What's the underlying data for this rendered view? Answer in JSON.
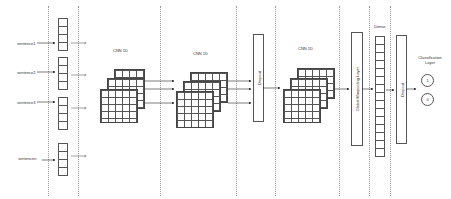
{
  "diagram": {
    "inputs": [
      {
        "label": "sentence1"
      },
      {
        "label": "sentence2"
      },
      {
        "label": "sentence3"
      },
      {
        "label": "sentencen"
      }
    ],
    "stages": {
      "cnn1": {
        "label": "CNN 1D"
      },
      "cnn2": {
        "label": "CNN 1D"
      },
      "dropout1": {
        "label": "Dropout"
      },
      "cnn3": {
        "label": "CNN 1D"
      },
      "global_pooling": {
        "label": "Global Maxpooling Layer"
      },
      "dense": {
        "label": "Dense"
      },
      "dropout2": {
        "label": "Dropout"
      },
      "classification": {
        "label": "Classification Layer",
        "classes": [
          "1",
          "0"
        ]
      }
    },
    "colors": {
      "stroke": "#555555",
      "divider": "#9a9a9a",
      "background": "#ffffff"
    }
  }
}
